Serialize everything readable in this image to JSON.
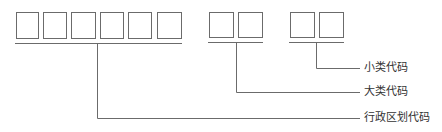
{
  "diagram": {
    "title": "",
    "groups": [
      {
        "name": "行政区划代码",
        "boxes": 6
      },
      {
        "name": "大类代码",
        "boxes": 2
      },
      {
        "name": "小类代码",
        "boxes": 2
      }
    ],
    "labels": {
      "small_class": "小类代码",
      "large_class": "大类代码",
      "admin_division": "行政区划代码"
    },
    "colors": {
      "line": "#6b6b6b",
      "text": "#333333"
    }
  }
}
